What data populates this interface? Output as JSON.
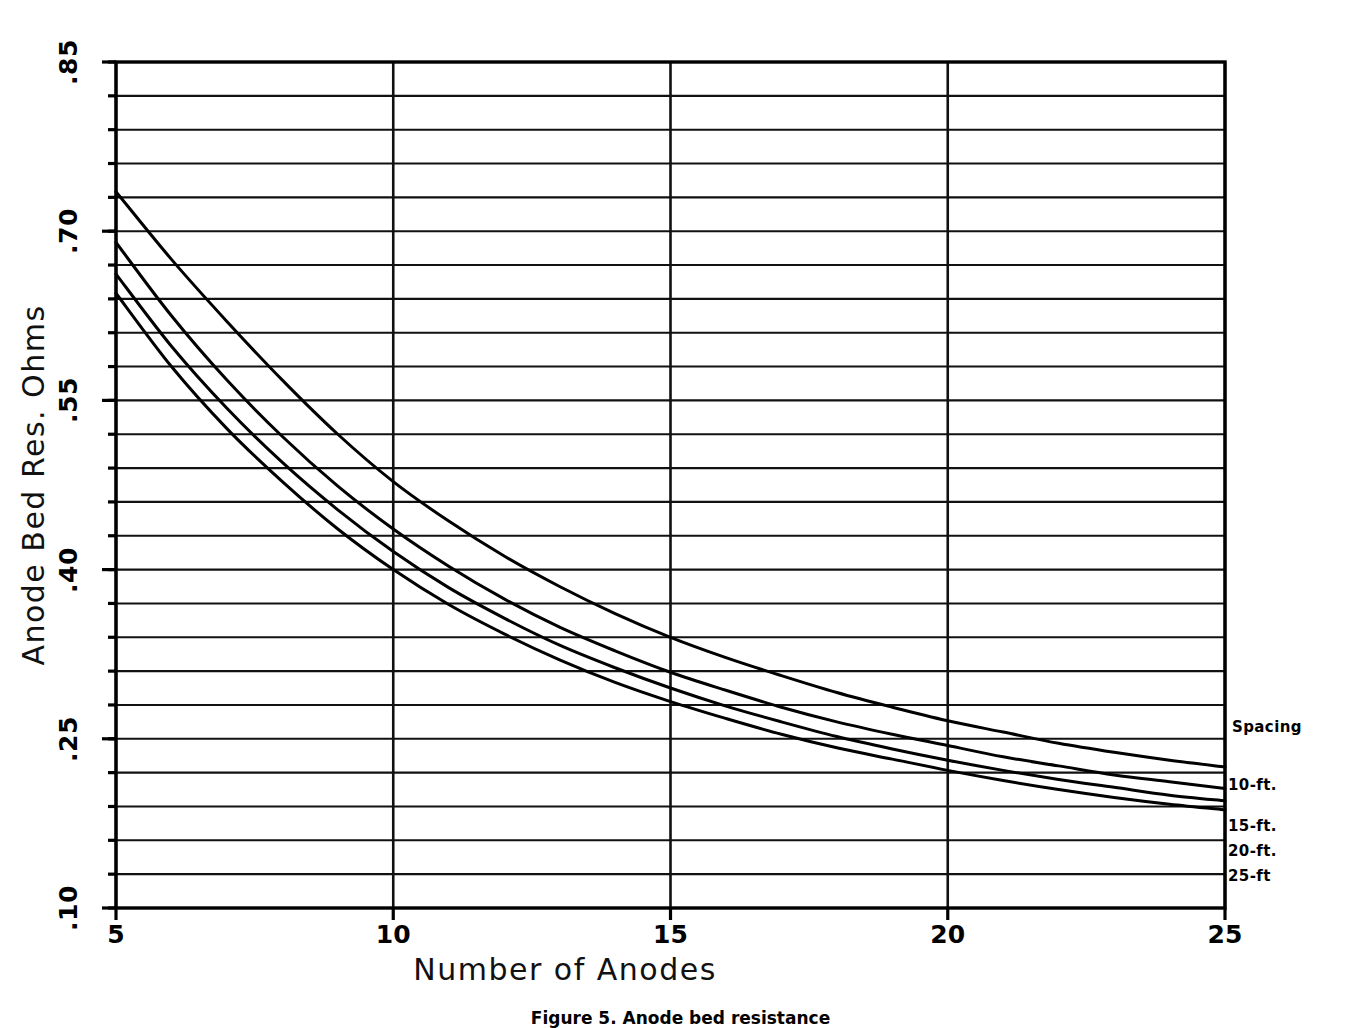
{
  "chart_data": {
    "type": "line",
    "title": "",
    "xlabel": "Number of Anodes",
    "ylabel": "Anode Bed Res. Ohms",
    "xlim": [
      5,
      25
    ],
    "ylim": [
      0.1,
      0.85
    ],
    "xticks": [
      "5",
      "10",
      "15",
      "20",
      "25"
    ],
    "xtick_values": [
      5,
      10,
      15,
      20,
      25
    ],
    "yticks": [
      ".85",
      ".70",
      ".55",
      ".40",
      ".25",
      ".10"
    ],
    "ytick_values": [
      0.85,
      0.7,
      0.55,
      0.4,
      0.25,
      0.1
    ],
    "grid": "horizontal gridlines every 0.03 ohms; vertical gridlines at every labeled x tick",
    "grid_y_step": 0.03,
    "legend_position": "right-outside",
    "legend_title": "Spacing",
    "x": [
      5,
      6,
      7,
      8,
      9,
      10,
      11,
      12,
      13,
      14,
      15,
      16,
      17,
      18,
      19,
      20,
      21,
      22,
      23,
      24,
      25
    ],
    "series": [
      {
        "name": "10-ft.",
        "label": "10-ft.",
        "values": [
          0.735,
          0.675,
          0.62,
          0.568,
          0.52,
          0.478,
          0.443,
          0.412,
          0.385,
          0.361,
          0.34,
          0.322,
          0.306,
          0.291,
          0.278,
          0.266,
          0.256,
          0.246,
          0.238,
          0.231,
          0.225
        ]
      },
      {
        "name": "15-ft.",
        "label": "15-ft.",
        "values": [
          0.69,
          0.625,
          0.568,
          0.518,
          0.474,
          0.436,
          0.403,
          0.374,
          0.349,
          0.328,
          0.309,
          0.293,
          0.278,
          0.265,
          0.254,
          0.244,
          0.234,
          0.226,
          0.218,
          0.212,
          0.206
        ]
      },
      {
        "name": "20-ft.",
        "label": "20-ft.",
        "values": [
          0.662,
          0.598,
          0.543,
          0.495,
          0.453,
          0.416,
          0.384,
          0.357,
          0.333,
          0.313,
          0.295,
          0.279,
          0.265,
          0.252,
          0.241,
          0.231,
          0.222,
          0.214,
          0.207,
          0.2,
          0.195
        ]
      },
      {
        "name": "25-ft",
        "label": "25-ft",
        "values": [
          0.645,
          0.58,
          0.525,
          0.478,
          0.436,
          0.4,
          0.369,
          0.343,
          0.32,
          0.3,
          0.283,
          0.268,
          0.254,
          0.242,
          0.232,
          0.222,
          0.213,
          0.205,
          0.198,
          0.192,
          0.187
        ]
      }
    ]
  },
  "axes": {
    "y_title": "Anode Bed Res. Ohms",
    "x_title": "Number of Anodes"
  },
  "legend": {
    "title": "Spacing",
    "entries": [
      {
        "label": "10-ft."
      },
      {
        "label": "15-ft."
      },
      {
        "label": "20-ft."
      },
      {
        "label": "25-ft"
      }
    ]
  },
  "caption": {
    "text": "Figure 5. Anode bed resistance"
  },
  "colors": {
    "ink": "#000000",
    "background": "#ffffff"
  }
}
